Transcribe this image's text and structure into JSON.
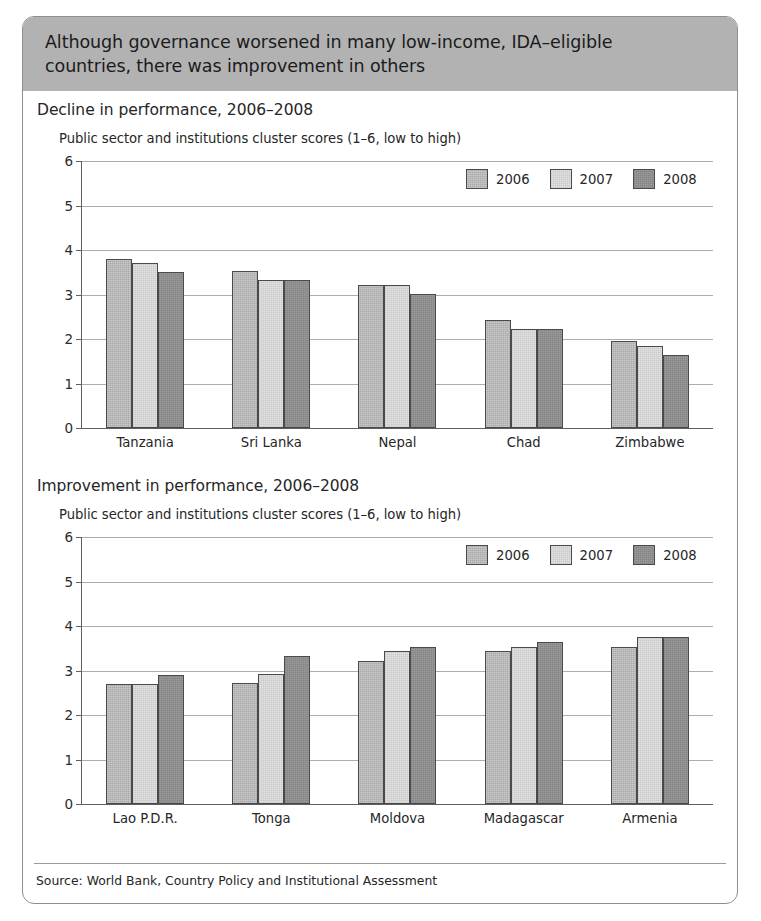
{
  "figure": {
    "header_line1": "Although governance worsened in many low-income, IDA–eligible",
    "header_line2": "countries, there was improvement in others",
    "source": "Source: World Bank, Country Policy and Institutional Assessment",
    "colors": {
      "header_band": "#b2b2b2",
      "frame_border": "#8f8f8f",
      "series_2006": "#a9a9a9",
      "series_2007": "#e2e2e2",
      "series_2008": "#9a9a9a",
      "gridline": "#adadad",
      "axis": "#5f5f5f"
    }
  },
  "chart_data": [
    {
      "type": "bar",
      "title": "Decline in performance, 2006–2008",
      "subtitle": "Public sector and institutions cluster scores (1–6, low to high)",
      "xlabel": "",
      "ylabel": "",
      "ylim": [
        0,
        6
      ],
      "yticks": [
        0,
        1,
        2,
        3,
        4,
        5,
        6
      ],
      "ytick_labels": [
        "0",
        "1",
        "2",
        "3",
        "4",
        "5",
        "6"
      ],
      "grid": true,
      "legend_position": "top-right",
      "categories": [
        "Tanzania",
        "Sri Lanka",
        "Nepal",
        "Chad",
        "Zimbabwe"
      ],
      "series": [
        {
          "name": "2006",
          "values": [
            3.8,
            3.52,
            3.22,
            2.42,
            1.95
          ]
        },
        {
          "name": "2007",
          "values": [
            3.71,
            3.32,
            3.22,
            2.22,
            1.85
          ]
        },
        {
          "name": "2008",
          "values": [
            3.51,
            3.32,
            3.02,
            2.22,
            1.64
          ]
        }
      ]
    },
    {
      "type": "bar",
      "title": "Improvement in performance, 2006–2008",
      "subtitle": "Public sector and institutions cluster scores (1–6, low to high)",
      "xlabel": "",
      "ylabel": "",
      "ylim": [
        0,
        6
      ],
      "yticks": [
        0,
        1,
        2,
        3,
        4,
        5,
        6
      ],
      "ytick_labels": [
        "0",
        "1",
        "2",
        "3",
        "4",
        "5",
        "6"
      ],
      "grid": true,
      "legend_position": "top-right",
      "categories": [
        "Lao P.D.R.",
        "Tonga",
        "Moldova",
        "Madagascar",
        "Armenia"
      ],
      "series": [
        {
          "name": "2006",
          "values": [
            2.7,
            2.73,
            3.22,
            3.43,
            3.53
          ]
        },
        {
          "name": "2007",
          "values": [
            2.7,
            2.93,
            3.43,
            3.53,
            3.75
          ]
        },
        {
          "name": "2008",
          "values": [
            2.91,
            3.32,
            3.53,
            3.63,
            3.75
          ]
        }
      ]
    }
  ]
}
